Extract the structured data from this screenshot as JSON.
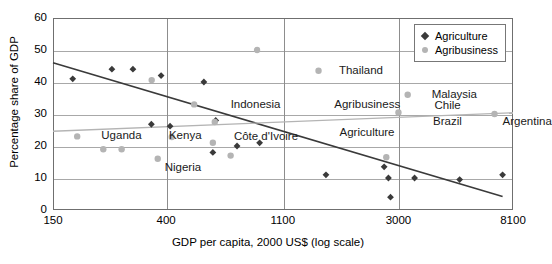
{
  "chart_data": {
    "type": "scatter",
    "title": "",
    "xlabel": "GDP per capita, 2000 US$ (log scale)",
    "ylabel": "Percentage share of GDP",
    "xscale": "log",
    "xlim": [
      150,
      8100
    ],
    "ylim": [
      0,
      60
    ],
    "xticks": [
      150,
      400,
      1100,
      3000,
      8100
    ],
    "xticklabels": [
      "150",
      "400",
      "1100",
      "3000",
      "8100"
    ],
    "yticks": [
      0,
      10,
      20,
      30,
      40,
      50,
      60
    ],
    "yticklabels": [
      "0",
      "10",
      "20",
      "30",
      "40",
      "50",
      "60"
    ],
    "grid": true,
    "legend_position": "top-right",
    "legend": [
      {
        "label": "Agriculture",
        "marker": "diamond",
        "color": "#3a3a3a"
      },
      {
        "label": "Agribusiness",
        "marker": "circle",
        "color": "#b4b4b4"
      }
    ],
    "series": [
      {
        "name": "Agriculture",
        "marker": "diamond",
        "color": "#3a3a3a",
        "points": [
          {
            "x": 178,
            "y": 41.0
          },
          {
            "x": 250,
            "y": 44.0
          },
          {
            "x": 300,
            "y": 44.0
          },
          {
            "x": 383,
            "y": 42.0
          },
          {
            "x": 352,
            "y": 26.8
          },
          {
            "x": 414,
            "y": 26.2
          },
          {
            "x": 555,
            "y": 40.0
          },
          {
            "x": 615,
            "y": 28.0
          },
          {
            "x": 600,
            "y": 18.0
          },
          {
            "x": 740,
            "y": 20.0
          },
          {
            "x": 900,
            "y": 21.0
          },
          {
            "x": 1600,
            "y": 11.0
          },
          {
            "x": 2650,
            "y": 13.5
          },
          {
            "x": 2750,
            "y": 10.0
          },
          {
            "x": 2800,
            "y": 4.0
          },
          {
            "x": 3450,
            "y": 10.0
          },
          {
            "x": 5100,
            "y": 9.5
          },
          {
            "x": 7400,
            "y": 11.0
          }
        ]
      },
      {
        "name": "Agribusiness",
        "marker": "circle",
        "color": "#b4b4b4",
        "points": [
          {
            "x": 185,
            "y": 23.0
          },
          {
            "x": 232,
            "y": 19.0
          },
          {
            "x": 272,
            "y": 19.0
          },
          {
            "x": 353,
            "y": 40.6
          },
          {
            "x": 372,
            "y": 16.0
          },
          {
            "x": 420,
            "y": 22.8
          },
          {
            "x": 600,
            "y": 21.0
          },
          {
            "x": 610,
            "y": 27.5
          },
          {
            "x": 700,
            "y": 17.0
          },
          {
            "x": 510,
            "y": 33.0
          },
          {
            "x": 880,
            "y": 50.0
          },
          {
            "x": 1500,
            "y": 43.5
          },
          {
            "x": 3000,
            "y": 30.5
          },
          {
            "x": 3250,
            "y": 36.0
          },
          {
            "x": 2700,
            "y": 16.5
          },
          {
            "x": 6900,
            "y": 30.0
          }
        ]
      }
    ],
    "trendlines": [
      {
        "name": "Agriculture",
        "color": "#3a3a3a",
        "x1": 150,
        "y1": 46.0,
        "x2": 7400,
        "y2": 4.2
      },
      {
        "name": "Agribusiness",
        "color": "#b4b4b4",
        "x1": 150,
        "y1": 24.6,
        "x2": 8100,
        "y2": 30.4
      }
    ],
    "annotations": [
      {
        "text": "Uganda",
        "x": 228,
        "y": 23.0
      },
      {
        "text": "Kenya",
        "x": 410,
        "y": 23.0
      },
      {
        "text": "Nigeria",
        "x": 395,
        "y": 13.2
      },
      {
        "text": "Côte d'Ivoire",
        "x": 720,
        "y": 22.8
      },
      {
        "text": "Indonesia",
        "x": 700,
        "y": 32.8
      },
      {
        "text": "Thailand",
        "x": 1790,
        "y": 43.5
      },
      {
        "text": "Malaysia",
        "x": 4000,
        "y": 36.0
      },
      {
        "text": "Chile",
        "x": 4100,
        "y": 32.5
      },
      {
        "text": "Brazil",
        "x": 4050,
        "y": 27.5
      },
      {
        "text": "Argentina",
        "x": 7400,
        "y": 27.5
      },
      {
        "text": "Agribusiness",
        "x": 1720,
        "y": 32.8
      },
      {
        "text": "Agriculture",
        "x": 1800,
        "y": 24.0
      }
    ]
  },
  "legend": {
    "agriculture_label": "Agriculture",
    "agribusiness_label": "Agribusiness"
  },
  "axes": {
    "x_title": "GDP per capita, 2000 US$ (log scale)",
    "y_title": "Percentage share of GDP"
  }
}
